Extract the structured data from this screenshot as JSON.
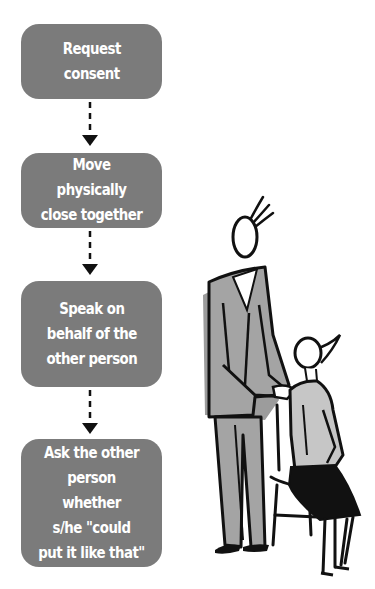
{
  "diagram": {
    "type": "vertical-flowchart",
    "box_color": "#7b7b7b",
    "text_color": "#ffffff",
    "connector_style": "dashed-arrow-down",
    "steps": [
      {
        "label": "Request\nconsent"
      },
      {
        "label": "Move physically\nclose together"
      },
      {
        "label": "Speak on\nbehalf of the\nother person"
      },
      {
        "label": "Ask the other\nperson whether\ns/he \"could\nput it like that\""
      }
    ],
    "illustration": {
      "description": "Standing man in grey suit with hands on shoulder of seated woman on a chair",
      "figures": [
        "standing-man",
        "seated-woman",
        "chair"
      ]
    }
  }
}
